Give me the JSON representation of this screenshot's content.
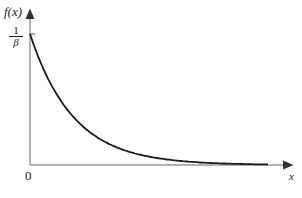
{
  "chart_data": {
    "type": "line",
    "title": "",
    "xlabel": "x",
    "ylabel": "f(x)",
    "function": "f(x) = (1/β) e^(-x/β)",
    "y_tick_labels": [
      "1/β"
    ],
    "x_tick_labels": [
      "0"
    ],
    "x": [
      0,
      0.5,
      1,
      1.5,
      2,
      2.5,
      3,
      3.5,
      4,
      4.5,
      5,
      5.5
    ],
    "series": [
      {
        "name": "f(x)",
        "values": [
          1.0,
          0.607,
          0.368,
          0.223,
          0.135,
          0.082,
          0.05,
          0.03,
          0.018,
          0.011,
          0.007,
          0.004
        ]
      }
    ],
    "grid": false,
    "legend": "none"
  },
  "labels": {
    "ylabel": "f(x)",
    "xlabel": "x",
    "origin": "0",
    "ytick_num": "1",
    "ytick_den": "β"
  }
}
